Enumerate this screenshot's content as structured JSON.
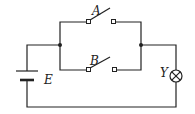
{
  "diagram": {
    "type": "electric-circuit",
    "labels": {
      "switch_a": "A",
      "switch_b": "B",
      "battery": "E",
      "lamp": "Y"
    },
    "components": [
      {
        "id": "E",
        "kind": "battery"
      },
      {
        "id": "A",
        "kind": "switch",
        "state": "open",
        "branch": "upper"
      },
      {
        "id": "B",
        "kind": "switch",
        "state": "open",
        "branch": "lower"
      },
      {
        "id": "Y",
        "kind": "lamp"
      }
    ],
    "colors": {
      "line": "#222222",
      "background": "#ffffff"
    }
  }
}
